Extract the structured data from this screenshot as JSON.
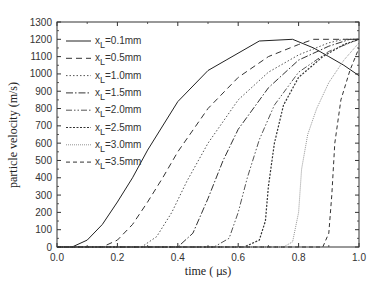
{
  "chart_data": {
    "type": "line",
    "title": "",
    "xlabel": "time ( μs)",
    "ylabel": "particle velocity (m/s)",
    "xlim": [
      0.0,
      1.0
    ],
    "ylim": [
      0,
      1300
    ],
    "grid": false,
    "legend_position": "upper-left",
    "x_ticks": [
      "0.0",
      "0.2",
      "0.4",
      "0.6",
      "0.8",
      "1.0"
    ],
    "y_ticks": [
      "0",
      "100",
      "200",
      "300",
      "400",
      "500",
      "600",
      "700",
      "800",
      "900",
      "1000",
      "1100",
      "1200",
      "1300"
    ],
    "series": [
      {
        "name": "x_L=0.1mm",
        "label_sub": "L",
        "label_rest": "=0.1mm",
        "style": "solid",
        "dash": "",
        "width": 1.0,
        "color": "#222222",
        "x": [
          0.0,
          0.05,
          0.1,
          0.15,
          0.2,
          0.25,
          0.3,
          0.4,
          0.5,
          0.56,
          0.67,
          0.78,
          0.85,
          0.9,
          0.95,
          1.0
        ],
        "y": [
          0,
          0,
          40,
          130,
          260,
          400,
          560,
          840,
          1020,
          1080,
          1190,
          1200,
          1150,
          1100,
          1050,
          990
        ]
      },
      {
        "name": "x_L=0.5mm",
        "label_sub": "L",
        "label_rest": "=0.5mm",
        "style": "dashed",
        "dash": "6,4",
        "width": 1.0,
        "color": "#333333",
        "x": [
          0.0,
          0.15,
          0.2,
          0.25,
          0.3,
          0.35,
          0.4,
          0.5,
          0.6,
          0.7,
          0.8,
          0.85,
          0.9,
          1.0
        ],
        "y": [
          0,
          0,
          40,
          130,
          260,
          400,
          550,
          800,
          980,
          1100,
          1170,
          1200,
          1200,
          1200
        ]
      },
      {
        "name": "x_L=1.0mm",
        "label_sub": "L",
        "label_rest": "=1.0mm",
        "style": "dotted",
        "dash": "1.5,2",
        "width": 1.0,
        "color": "#555555",
        "x": [
          0.0,
          0.28,
          0.33,
          0.38,
          0.43,
          0.5,
          0.6,
          0.7,
          0.8,
          0.9,
          0.95,
          1.0
        ],
        "y": [
          0,
          0,
          60,
          200,
          380,
          600,
          850,
          1010,
          1110,
          1180,
          1200,
          1200
        ]
      },
      {
        "name": "x_L=1.5mm",
        "label_sub": "L",
        "label_rest": "=1.5mm",
        "style": "dash-dot",
        "dash": "7,2,1.5,2",
        "width": 1.0,
        "color": "#333333",
        "x": [
          0.0,
          0.4,
          0.45,
          0.5,
          0.55,
          0.6,
          0.7,
          0.8,
          0.9,
          0.97,
          1.0
        ],
        "y": [
          0,
          0,
          80,
          280,
          500,
          680,
          920,
          1080,
          1160,
          1200,
          1200
        ]
      },
      {
        "name": "x_L=2.0mm",
        "label_sub": "L",
        "label_rest": "=2.0mm",
        "style": "dash-dot-dot",
        "dash": "6,2,1.5,2,1.5,2",
        "width": 1.0,
        "color": "#555555",
        "x": [
          0.0,
          0.52,
          0.57,
          0.6,
          0.63,
          0.67,
          0.72,
          0.8,
          0.9,
          1.0
        ],
        "y": [
          0,
          0,
          50,
          200,
          400,
          620,
          820,
          1010,
          1130,
          1200
        ]
      },
      {
        "name": "x_L=2.5mm",
        "label_sub": "L",
        "label_rest": "=2.5mm",
        "style": "short-dot",
        "dash": "2,1.5",
        "width": 1.2,
        "color": "#333333",
        "x": [
          0.0,
          0.62,
          0.67,
          0.69,
          0.7,
          0.72,
          0.75,
          0.8,
          0.88,
          0.95,
          1.0
        ],
        "y": [
          0,
          0,
          40,
          150,
          350,
          600,
          820,
          980,
          1100,
          1170,
          1200
        ]
      },
      {
        "name": "x_L=3.0mm",
        "label_sub": "L",
        "label_rest": "=3.0mm",
        "style": "short-dash-fine",
        "dash": "1,1",
        "width": 0.9,
        "color": "#888888",
        "x": [
          0.0,
          0.75,
          0.78,
          0.8,
          0.81,
          0.83,
          0.86,
          0.9,
          0.95,
          1.0
        ],
        "y": [
          0,
          0,
          30,
          200,
          450,
          650,
          800,
          950,
          1080,
          1180
        ]
      },
      {
        "name": "x_L=3.5mm",
        "label_sub": "L",
        "label_rest": "=3.5mm",
        "style": "dashed-short",
        "dash": "4,3",
        "width": 1.0,
        "color": "#333333",
        "x": [
          0.0,
          0.88,
          0.9,
          0.91,
          0.92,
          0.94,
          0.97,
          1.0
        ],
        "y": [
          0,
          0,
          80,
          300,
          600,
          850,
          1020,
          1150
        ]
      }
    ]
  },
  "labels": {
    "xlabel_prefix": "time ( ",
    "xlabel_mu": "μ",
    "xlabel_suffix": "s)",
    "ylabel": "particle velocity (m/s)",
    "legend_prefix": "x"
  }
}
